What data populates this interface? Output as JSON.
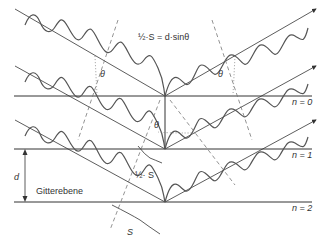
{
  "diagram": {
    "title_equation": "½·S = d·sinθ",
    "labels": {
      "theta": "θ",
      "half_s": "½· S",
      "s": "S",
      "d": "d",
      "grating_plane": "Gitterebene",
      "n0": "n = 0",
      "n1": "n = 1",
      "n2": "n = 2"
    },
    "planes": [
      {
        "name": "n = 0",
        "y": 96
      },
      {
        "name": "n = 1",
        "y": 149
      },
      {
        "name": "n = 2",
        "y": 202
      }
    ],
    "colors": {
      "line": "#333333",
      "wave": "#555555",
      "dashed": "#777777"
    }
  }
}
